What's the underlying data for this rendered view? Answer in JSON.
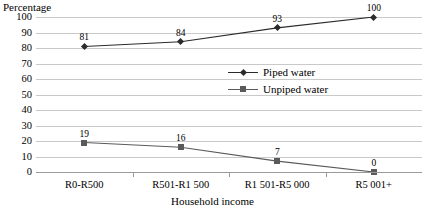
{
  "chart_data": {
    "type": "line",
    "title": "",
    "xlabel": "Household income",
    "ylabel": "Percentage",
    "categories": [
      "R0-R500",
      "R501-R1 500",
      "R1 501-R5 000",
      "R5 001+"
    ],
    "series": [
      {
        "name": "Piped water",
        "marker": "diamond",
        "color": "#2b2b2b",
        "values": [
          81,
          84,
          93,
          100
        ]
      },
      {
        "name": "Unpiped water",
        "marker": "square",
        "color": "#5a5a5a",
        "values": [
          19,
          16,
          7,
          0
        ]
      }
    ],
    "ylim": [
      0,
      100
    ],
    "ytick_step": 10,
    "yticks": [
      100,
      90,
      80,
      70,
      60,
      50,
      40,
      30,
      20,
      10,
      0
    ],
    "grid": true,
    "legend_position": "center-right-inside"
  },
  "axes": {
    "y_title": "Percentage",
    "x_title": "Household income"
  },
  "legend": {
    "items": [
      {
        "label": "Piped water",
        "marker": "diamond-marker"
      },
      {
        "label": "Unpiped water",
        "marker": "square-marker"
      }
    ]
  },
  "colors": {
    "gridline": "#c9c9c9",
    "axis": "#9a9a9a",
    "series_piped": "#2b2b2b",
    "series_unpiped": "#5a5a5a",
    "text": "#000000",
    "background": "#ffffff"
  }
}
